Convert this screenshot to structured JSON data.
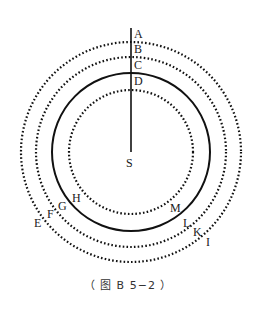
{
  "figure": {
    "caption": "（ 图 B 5−2 ）",
    "center_label": "S",
    "center": {
      "x": 131,
      "y": 152
    },
    "circles": [
      {
        "name": "outer-dotted-circle",
        "r": 110,
        "style": "dotted"
      },
      {
        "name": "second-dotted-circle",
        "r": 95,
        "style": "dotted"
      },
      {
        "name": "solid-circle",
        "r": 79,
        "style": "solid"
      },
      {
        "name": "inner-dotted-circle",
        "r": 62,
        "style": "dotted"
      }
    ],
    "radial_line": {
      "x": 131,
      "y_top": 28,
      "y_bottom": 152
    },
    "top_labels": [
      "A",
      "B",
      "C",
      "D"
    ],
    "left_labels": [
      "E",
      "F",
      "G",
      "H"
    ],
    "right_labels": [
      "I",
      "K",
      "L",
      "M"
    ],
    "colors": {
      "ink": "#111111",
      "background": "#ffffff"
    }
  }
}
